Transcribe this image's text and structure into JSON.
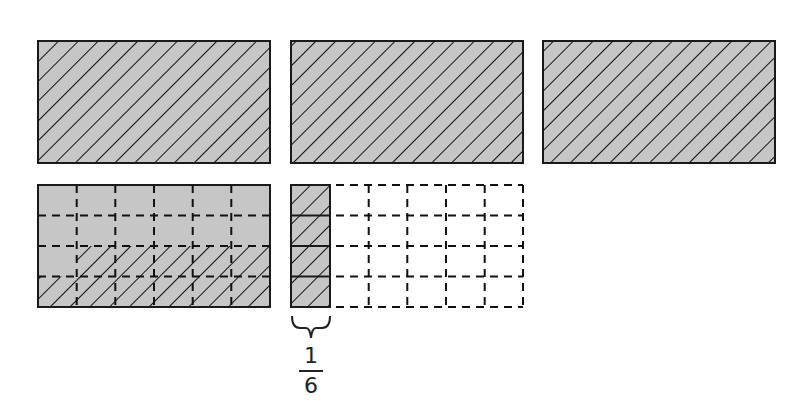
{
  "diagram": {
    "colors": {
      "fill": "#c6c6c6",
      "stroke": "#1a1a1a",
      "hatch": "#111111",
      "background": "#ffffff"
    },
    "top_row": [
      {
        "id": "whole-1",
        "x": 38,
        "y": 41,
        "w": 232,
        "h": 122,
        "hatched": true
      },
      {
        "id": "whole-2",
        "x": 291,
        "y": 41,
        "w": 232,
        "h": 122,
        "hatched": true
      },
      {
        "id": "whole-3",
        "x": 543,
        "y": 41,
        "w": 232,
        "h": 122,
        "hatched": true
      }
    ],
    "grid_rect": {
      "x": 38,
      "y": 185,
      "w": 232,
      "h": 122,
      "cols": 6,
      "rows": 4
    },
    "strip": {
      "x": 291,
      "y": 185,
      "w": 39,
      "h": 122,
      "rows": 4
    },
    "dashed_grid": {
      "x": 330,
      "y": 185,
      "w": 193,
      "h": 122,
      "cols": 5,
      "rows": 4
    },
    "label": {
      "numerator": "1",
      "denominator": "6"
    }
  }
}
